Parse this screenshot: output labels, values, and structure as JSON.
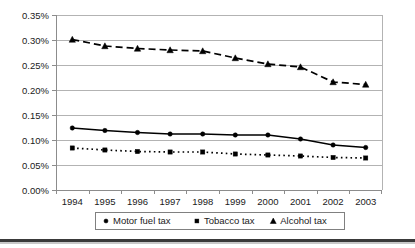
{
  "chart_data": {
    "type": "line",
    "title": "",
    "subtitle": "",
    "xlabel": "",
    "ylabel": "",
    "categories": [
      "1994",
      "1995",
      "1996",
      "1997",
      "1998",
      "1999",
      "2000",
      "2001",
      "2002",
      "2003"
    ],
    "series": [
      {
        "name": "Motor fuel tax",
        "marker": "circle",
        "linestyle": "solid",
        "values": [
          0.124,
          0.119,
          0.115,
          0.112,
          0.112,
          0.11,
          0.11,
          0.102,
          0.09,
          0.085
        ]
      },
      {
        "name": "Tobacco tax",
        "marker": "square",
        "linestyle": "dotted",
        "values": [
          0.084,
          0.08,
          0.077,
          0.076,
          0.076,
          0.072,
          0.07,
          0.068,
          0.065,
          0.064
        ]
      },
      {
        "name": "Alcohol tax",
        "marker": "triangle",
        "linestyle": "dashed",
        "values": [
          0.301,
          0.288,
          0.283,
          0.28,
          0.278,
          0.264,
          0.252,
          0.246,
          0.216,
          0.211
        ]
      }
    ],
    "ylim": [
      0,
      0.35
    ],
    "ytick_values": [
      0.0,
      0.05,
      0.1,
      0.15,
      0.2,
      0.25,
      0.3,
      0.35
    ],
    "ytick_labels": [
      "0.00%",
      "0.05%",
      "0.10%",
      "0.15%",
      "0.20%",
      "0.25%",
      "0.30%",
      "0.35%"
    ],
    "grid": true,
    "legend_position": "bottom",
    "legend_entries": [
      {
        "label": "Motor fuel tax",
        "marker": "circle"
      },
      {
        "label": "Tobacco tax",
        "marker": "square"
      },
      {
        "label": "Alcohol tax",
        "marker": "triangle"
      }
    ],
    "accent_color": "#000000",
    "grid_color": "#b3b3b3",
    "background_color": "#ffffff"
  }
}
